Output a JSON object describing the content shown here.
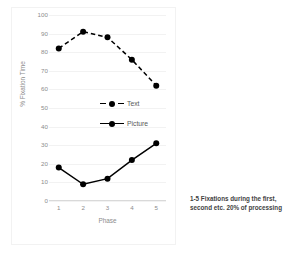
{
  "chart_data": {
    "type": "line",
    "title": "",
    "xlabel": "Phase",
    "ylabel": "% Fixation Time",
    "categories": [
      "1",
      "2",
      "3",
      "4",
      "5"
    ],
    "x": [
      1,
      2,
      3,
      4,
      5
    ],
    "xlim": [
      0.6,
      5.4
    ],
    "ylim": [
      0,
      100
    ],
    "yticks": [
      0,
      10,
      20,
      30,
      40,
      50,
      60,
      70,
      80,
      90,
      100
    ],
    "ytick_labels": [
      "0",
      "10",
      "20",
      "30",
      "40",
      "50",
      "60",
      "70",
      "80",
      "90",
      "100"
    ],
    "grid": true,
    "grid_axis": "y",
    "legend_position": "center-left-inside",
    "series": [
      {
        "name": "Text",
        "values": [
          82,
          91,
          88,
          76,
          62
        ],
        "linestyle": "dashed",
        "marker": "circle",
        "color": "#000000"
      },
      {
        "name": "Picture",
        "values": [
          18,
          9,
          12,
          22,
          31
        ],
        "linestyle": "solid",
        "marker": "circle",
        "color": "#000000"
      }
    ],
    "annotations": [
      "1-5   Fixations during the first,",
      "second etc. 20% of processing"
    ]
  },
  "axis": {
    "x_title": "Phase",
    "y_title": "% Fixation Time"
  },
  "legend": {
    "entries": [
      {
        "label": "Text"
      },
      {
        "label": "Picture"
      }
    ]
  },
  "annotation": {
    "line1": "1-5   Fixations during the first,",
    "line2": "second etc. 20% of processing"
  },
  "colors": {
    "series": "#000000",
    "grid": "#f2f2f2",
    "tick_text": "#8c8c8c",
    "annotation_text": "#3f3f3f",
    "background": "#ffffff"
  }
}
